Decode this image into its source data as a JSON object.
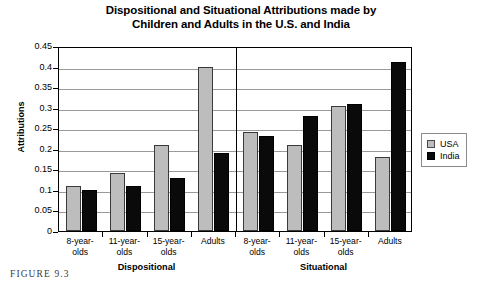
{
  "figure": {
    "caption": "FIGURE 9.3"
  },
  "legend": {
    "position": "right",
    "entries": [
      {
        "label": "USA",
        "color": "#bdbdbd",
        "swatch": "usa-swatch"
      },
      {
        "label": "India",
        "color": "#0a0a0a",
        "swatch": "india-swatch"
      }
    ]
  },
  "chart_data": {
    "type": "bar",
    "title": "Dispositional and Situational Attributions made by Children and Adults in the U.S. and India",
    "title_line1": "Dispositional and Situational Attributions made by",
    "title_line2": "Children and Adults in the U.S. and India",
    "xlabel": "",
    "ylabel": "Attributions",
    "ylim": [
      0,
      0.45
    ],
    "ytick_values": [
      0,
      0.05,
      0.1,
      0.15,
      0.2,
      0.25,
      0.3,
      0.35,
      0.4,
      0.45
    ],
    "ytick_labels": [
      "0",
      "0.05",
      "0.1",
      "0.15",
      "0.2",
      "0.25",
      "0.3",
      "0.35",
      "0.4",
      "0.45"
    ],
    "grid": true,
    "grid_axis": "y",
    "legend_position": "right",
    "categories": [
      "8-year-olds",
      "11-year-olds",
      "15-year-olds",
      "Adults",
      "8-year-olds",
      "11-year-olds",
      "15-year-olds",
      "Adults"
    ],
    "category_lines": [
      [
        "8-year-",
        "olds"
      ],
      [
        "11-year-",
        "olds"
      ],
      [
        "15-year-",
        "olds"
      ],
      [
        "Adults",
        ""
      ],
      [
        "8-year-",
        "olds"
      ],
      [
        "11-year-",
        "olds"
      ],
      [
        "15-year-",
        "olds"
      ],
      [
        "Adults",
        ""
      ]
    ],
    "group_labels": [
      "Dispositional",
      "Situational"
    ],
    "groups": [
      {
        "name": "Dispositional",
        "category_indices": [
          0,
          1,
          2,
          3
        ]
      },
      {
        "name": "Situational",
        "category_indices": [
          4,
          5,
          6,
          7
        ]
      }
    ],
    "series": [
      {
        "name": "USA",
        "color": "#bdbdbd",
        "values": [
          0.11,
          0.14,
          0.21,
          0.4,
          0.24,
          0.21,
          0.305,
          0.18
        ]
      },
      {
        "name": "India",
        "color": "#0a0a0a",
        "values": [
          0.1,
          0.11,
          0.13,
          0.19,
          0.23,
          0.28,
          0.31,
          0.41
        ]
      }
    ]
  }
}
